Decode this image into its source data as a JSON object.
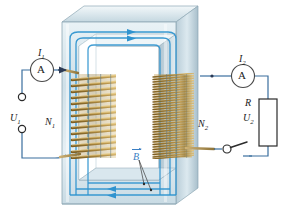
{
  "figure": {
    "background_color": "#ffffff",
    "width": 284,
    "height": 224
  },
  "colors": {
    "wire": "#3a6e9e",
    "flux": "#3fa0d8",
    "core_light": "#dfeaef",
    "core_mid": "#bcd2dc",
    "core_dark": "#9fb6c2",
    "copper_light": "#d6b46a",
    "copper_dark": "#8a6a2e",
    "label_text": "#1b1b1b",
    "b_label": "#3a7fc4"
  },
  "labels": {
    "current_primary": "I",
    "current_primary_sub": "1",
    "current_secondary": "I",
    "current_secondary_sub": "2",
    "turns_primary": "N",
    "turns_primary_sub": "1",
    "turns_secondary": "N",
    "turns_secondary_sub": "2",
    "voltage_primary": "U",
    "voltage_primary_sub": "1",
    "voltage_secondary": "U",
    "voltage_secondary_sub": "2",
    "resistor": "R",
    "flux_density": "B"
  },
  "components": {
    "ammeter_primary": {
      "glyph": "A",
      "name": "ammeter"
    },
    "ammeter_secondary": {
      "glyph": "A",
      "name": "ammeter"
    },
    "switch": {
      "state": "open"
    },
    "terminals": {
      "count": 2
    },
    "resistor_box": {
      "label": "R"
    }
  },
  "coils": {
    "primary": {
      "turns_drawn": 14,
      "label": "N1"
    },
    "secondary": {
      "turns_drawn": 34,
      "label": "N2"
    }
  },
  "flux": {
    "direction_top": "right",
    "direction_bottom": "left",
    "line_count": 3,
    "arrow_count_top": 2,
    "arrow_count_bottom": 2
  }
}
